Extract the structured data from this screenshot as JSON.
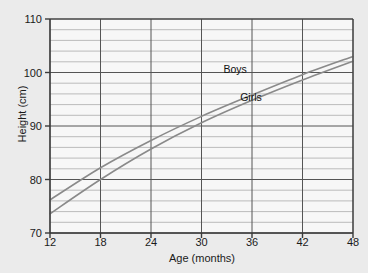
{
  "chart_data": {
    "type": "line",
    "title": "",
    "xlabel": "Age (months)",
    "ylabel": "Height (cm)",
    "xlim": [
      12,
      48
    ],
    "ylim": [
      70,
      110
    ],
    "x_ticks": [
      12,
      18,
      24,
      30,
      36,
      42,
      48
    ],
    "y_ticks": [
      70,
      80,
      90,
      100,
      110
    ],
    "y_minor_step": 2,
    "grid": true,
    "legend_position": "inline-annotation",
    "background_color": "#ebebeb",
    "plot_background_color": "#f7f7f7",
    "line_color": "#8a8a8a",
    "axis_color": "#3a3a3a",
    "major_grid_color": "#555555",
    "minor_grid_color": "#bbbbbb",
    "x": [
      12,
      18,
      24,
      30,
      36,
      42,
      48
    ],
    "series": [
      {
        "name": "Boys",
        "label": "Boys",
        "values": [
          76.2,
          82.2,
          87.3,
          91.8,
          95.8,
          99.6,
          103.0
        ],
        "label_x": 32.6,
        "label_y": 100.4
      },
      {
        "name": "Girls",
        "label": "Girls",
        "values": [
          73.6,
          80.0,
          85.7,
          90.6,
          94.8,
          98.6,
          102.1
        ],
        "label_x": 34.6,
        "label_y": 95.3
      }
    ]
  }
}
